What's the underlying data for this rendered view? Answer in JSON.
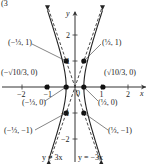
{
  "chart_data": {
    "type": "line",
    "title": "",
    "xlabel": "x",
    "ylabel": "y",
    "xlim": [
      -2.8,
      2.8
    ],
    "ylim": [
      -3,
      3.2
    ],
    "x_ticks": [
      -2,
      -1,
      1,
      2
    ],
    "y_ticks": [
      2,
      1,
      -1,
      -2
    ],
    "x_tick_labels": [
      "−2",
      "−1",
      "1",
      "2"
    ],
    "y_tick_labels": [
      "2",
      "1",
      "−1",
      "−2"
    ],
    "origin_label": "0",
    "curve": {
      "name": "hyperbola",
      "equation": "9x² − y² = 1",
      "style": "solid"
    },
    "asymptotes": [
      {
        "name": "y = 3x",
        "slope": 3,
        "label": "y = 3x",
        "style": "dashed"
      },
      {
        "name": "y = −3x",
        "slope": -3,
        "label": "y = −3x",
        "style": "dashed"
      }
    ],
    "points": [
      {
        "x": -0.3333,
        "y": 1,
        "label": "(−⅓, 1)"
      },
      {
        "x": 0.3333,
        "y": 1,
        "label": "(⅓, 1)"
      },
      {
        "x": -1.0541,
        "y": 0,
        "label": "(−√10/3, 0)"
      },
      {
        "x": 1.0541,
        "y": 0,
        "label": "(√10/3, 0)"
      },
      {
        "x": -0.3333,
        "y": 0,
        "label": "(−⅓, 0)"
      },
      {
        "x": 0.3333,
        "y": 0,
        "label": "(⅓, 0)"
      },
      {
        "x": -0.3333,
        "y": -1,
        "label": "(−⅓, −1)"
      },
      {
        "x": 0.3333,
        "y": -1,
        "label": "(⅓, −1)"
      }
    ],
    "top_partial_text": "(3"
  }
}
